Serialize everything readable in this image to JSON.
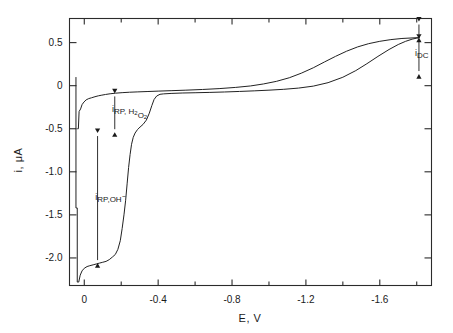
{
  "chart_data": {
    "type": "line",
    "title": "",
    "xlabel": "E, V",
    "ylabel": "i, μA",
    "xlim": [
      0.08,
      -1.88
    ],
    "ylim": [
      -2.32,
      0.78
    ],
    "grid": false,
    "legend_position": "none",
    "xticks": [
      0,
      -0.4,
      -0.8,
      -1.2,
      -1.6
    ],
    "xtick_labels": [
      "0",
      "-0.4",
      "-0.8",
      "-1.2",
      "-1.6"
    ],
    "xminor_ticks": [
      -0.2,
      -0.6,
      -1.0,
      -1.4,
      -1.8
    ],
    "yticks": [
      0.5,
      0,
      -0.5,
      -1.0,
      -1.5,
      -2.0
    ],
    "ytick_labels": [
      "0.5",
      "0",
      "-0.5",
      "-1.0",
      "-1.5",
      "-2.0"
    ],
    "series": [
      {
        "name": "forward-scan-staircase",
        "comment": "cathodic-going branch showing two reduction waves as a staircase",
        "points": [
          [
            0.045,
            0.1
          ],
          [
            0.045,
            -1.42
          ],
          [
            0.038,
            -1.42
          ],
          [
            0.038,
            -2.28
          ],
          [
            0.03,
            -2.28
          ],
          [
            0.022,
            -2.2
          ],
          [
            0.012,
            -2.15
          ],
          [
            0.0,
            -2.12
          ],
          [
            -0.015,
            -2.1
          ],
          [
            -0.03,
            -2.09
          ],
          [
            -0.048,
            -2.08
          ],
          [
            -0.065,
            -2.07
          ],
          [
            -0.082,
            -2.06
          ],
          [
            -0.1,
            -2.05
          ],
          [
            -0.118,
            -2.04
          ],
          [
            -0.135,
            -2.02
          ],
          [
            -0.152,
            -1.99
          ],
          [
            -0.168,
            -1.96
          ],
          [
            -0.182,
            -1.9
          ],
          [
            -0.195,
            -1.8
          ],
          [
            -0.205,
            -1.66
          ],
          [
            -0.215,
            -1.5
          ],
          [
            -0.224,
            -1.33
          ],
          [
            -0.232,
            -1.14
          ],
          [
            -0.24,
            -0.95
          ],
          [
            -0.248,
            -0.8
          ],
          [
            -0.256,
            -0.68
          ],
          [
            -0.265,
            -0.6
          ],
          [
            -0.275,
            -0.55
          ],
          [
            -0.288,
            -0.51
          ],
          [
            -0.302,
            -0.48
          ],
          [
            -0.318,
            -0.45
          ],
          [
            -0.336,
            -0.4
          ],
          [
            -0.352,
            -0.32
          ],
          [
            -0.366,
            -0.23
          ],
          [
            -0.378,
            -0.16
          ],
          [
            -0.392,
            -0.12
          ],
          [
            -0.41,
            -0.1
          ],
          [
            -0.43,
            -0.095
          ],
          [
            -0.47,
            -0.09
          ],
          [
            -0.53,
            -0.085
          ],
          [
            -0.6,
            -0.082
          ],
          [
            -0.68,
            -0.078
          ],
          [
            -0.76,
            -0.073
          ],
          [
            -0.84,
            -0.067
          ],
          [
            -0.92,
            -0.06
          ],
          [
            -1.0,
            -0.052
          ],
          [
            -1.08,
            -0.042
          ],
          [
            -1.16,
            -0.028
          ],
          [
            -1.24,
            -0.005
          ],
          [
            -1.32,
            0.035
          ],
          [
            -1.4,
            0.098
          ],
          [
            -1.47,
            0.175
          ],
          [
            -1.53,
            0.255
          ],
          [
            -1.59,
            0.34
          ],
          [
            -1.65,
            0.42
          ],
          [
            -1.7,
            0.478
          ],
          [
            -1.74,
            0.515
          ],
          [
            -1.775,
            0.54
          ],
          [
            -1.8,
            0.552
          ],
          [
            -1.815,
            0.558
          ]
        ]
      },
      {
        "name": "reverse-scan-upper",
        "comment": "anodic-going return branch, smooth upper envelope",
        "points": [
          [
            0.038,
            -0.5
          ],
          [
            0.032,
            -0.5
          ],
          [
            0.028,
            -0.3
          ],
          [
            0.02,
            -0.27
          ],
          [
            0.012,
            -0.22
          ],
          [
            0.002,
            -0.19
          ],
          [
            -0.01,
            -0.165
          ],
          [
            -0.024,
            -0.15
          ],
          [
            -0.04,
            -0.14
          ],
          [
            -0.058,
            -0.128
          ],
          [
            -0.076,
            -0.118
          ],
          [
            -0.095,
            -0.11
          ],
          [
            -0.115,
            -0.102
          ],
          [
            -0.14,
            -0.094
          ],
          [
            -0.17,
            -0.087
          ],
          [
            -0.205,
            -0.081
          ],
          [
            -0.245,
            -0.076
          ],
          [
            -0.29,
            -0.072
          ],
          [
            -0.34,
            -0.068
          ],
          [
            -0.4,
            -0.063
          ],
          [
            -0.47,
            -0.058
          ],
          [
            -0.55,
            -0.052
          ],
          [
            -0.64,
            -0.044
          ],
          [
            -0.73,
            -0.034
          ],
          [
            -0.82,
            -0.02
          ],
          [
            -0.9,
            -0.003
          ],
          [
            -0.97,
            0.02
          ],
          [
            -1.04,
            0.05
          ],
          [
            -1.11,
            0.092
          ],
          [
            -1.175,
            0.145
          ],
          [
            -1.24,
            0.208
          ],
          [
            -1.3,
            0.275
          ],
          [
            -1.36,
            0.34
          ],
          [
            -1.42,
            0.4
          ],
          [
            -1.48,
            0.45
          ],
          [
            -1.54,
            0.488
          ],
          [
            -1.6,
            0.515
          ],
          [
            -1.66,
            0.535
          ],
          [
            -1.72,
            0.548
          ],
          [
            -1.78,
            0.555
          ],
          [
            -1.815,
            0.558
          ]
        ]
      }
    ],
    "annotations": [
      {
        "name": "i_RP,H2O2",
        "label_parts": [
          {
            "t": "i",
            "style": "normal"
          },
          {
            "t": "RP, H",
            "style": "sub"
          },
          {
            "t": "2",
            "style": "subsub"
          },
          {
            "t": "O",
            "style": "sub"
          },
          {
            "t": "2",
            "style": "subsub"
          }
        ],
        "plain_text": "i_RP, H2O2",
        "arrow_x": -0.165,
        "arrow_y_top": -0.09,
        "arrow_y_bottom": -0.54,
        "label_x": -0.15,
        "label_y": -0.3
      },
      {
        "name": "i_RP,OH-",
        "label_parts": [
          {
            "t": "i",
            "style": "normal"
          },
          {
            "t": "RP,OH",
            "style": "sub"
          },
          {
            "t": "−",
            "style": "sup"
          }
        ],
        "plain_text": "i_RP,OH-",
        "arrow_x": -0.072,
        "arrow_y_top": -0.55,
        "arrow_y_bottom": -2.06,
        "label_x": -0.06,
        "label_y": -1.33
      },
      {
        "name": "i_DC",
        "label_parts": [
          {
            "t": "i",
            "style": "normal"
          },
          {
            "t": "DC",
            "style": "sub"
          }
        ],
        "plain_text": "i_DC",
        "arrow_x": -1.812,
        "arrow_y_top": 0.745,
        "arrow_y_bottom": 0.558,
        "arrow2_y_top": 0.545,
        "arrow2_y_bottom": 0.135,
        "label_x": -1.79,
        "label_y": 0.345
      }
    ]
  }
}
